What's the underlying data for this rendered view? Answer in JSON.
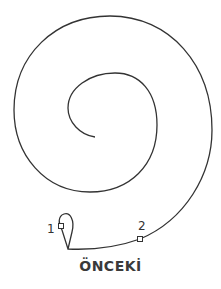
{
  "diagram": {
    "title": "ÖNCEKİ",
    "points": [
      {
        "label": "1",
        "x": 61,
        "y": 226
      },
      {
        "label": "2",
        "x": 140,
        "y": 239
      }
    ],
    "colors": {
      "stroke": "#333333",
      "text": "#3a3a3a"
    }
  }
}
